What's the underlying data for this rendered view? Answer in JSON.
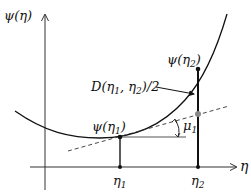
{
  "labels": {
    "y_axis": "ψ(η)",
    "x_axis": "η",
    "psi_eta1": "ψ(η",
    "psi_eta1_sub": "1",
    "psi_eta2": "ψ(η",
    "psi_eta2_sub": "2",
    "d_label": "D(η",
    "d_label_sub1": "1",
    "d_label_mid": ", η",
    "d_label_sub2": "2",
    "d_label_tail": ")/2",
    "close_paren": ")",
    "eta1": "η",
    "eta1_sub": "1",
    "eta2": "η",
    "eta2_sub": "2",
    "mu1": "μ",
    "mu1_sub": "1"
  },
  "colors": {
    "curve": "#111111",
    "axis": "#333333",
    "tangent": "#333333",
    "gray_point": "#888888",
    "horizontal_ref": "#555555"
  }
}
